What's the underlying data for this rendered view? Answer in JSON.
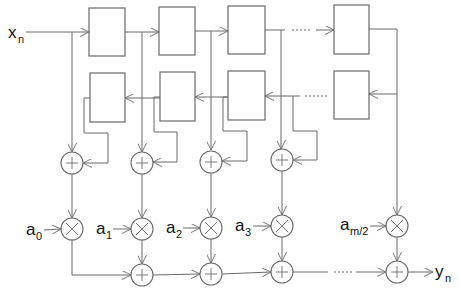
{
  "diagram": {
    "type": "symmetric FIR filter signal-flow graph",
    "input": {
      "label": "x",
      "subscript": "n"
    },
    "output": {
      "label": "y",
      "subscript": "n"
    },
    "coefficients": [
      {
        "label": "a",
        "subscript": "0"
      },
      {
        "label": "a",
        "subscript": "1"
      },
      {
        "label": "a",
        "subscript": "2"
      },
      {
        "label": "a",
        "subscript": "3"
      },
      {
        "label": "a",
        "subscript": "m/2"
      }
    ],
    "rows": {
      "forward_delays": "top row of delay blocks, signal flows left to right",
      "backward_delays": "second row of delay blocks, signal flows right to left"
    },
    "node_symbols": {
      "adder": "+",
      "multiplier": "×"
    },
    "ellipsis": "......"
  }
}
